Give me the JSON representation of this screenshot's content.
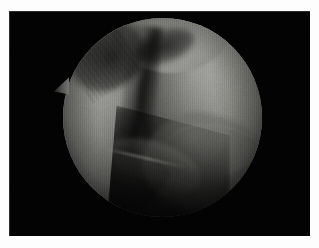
{
  "image": {
    "kind": "arthroscopic-photograph",
    "caption": "Arthroscopic view of a knee joint showing two opposing cartilage-covered condylar surfaces separated by a dark intercondylar fissure.",
    "medium": "endoscopic video still print",
    "orientation": "landscape"
  },
  "mount": {
    "name": "white photographic border",
    "color": "#fdfdfd",
    "border_left_px": 9,
    "border_top_px": 11
  },
  "frame": {
    "name": "photograph",
    "background_color": "#020202",
    "left_px": 9,
    "top_px": 11,
    "width_px": 301,
    "height_px": 225
  },
  "scope_field": {
    "name": "circular endoscope field of view",
    "shape": "circle",
    "center_x_px": 162,
    "center_y_px": 117,
    "radius_px": 99,
    "vignette": "strong",
    "scanlines": "vertical interlace texture"
  },
  "anatomy": {
    "structures": [
      {
        "id": "condyle-left",
        "label": "Left condylar surface",
        "tone": "mid grey",
        "highlight_color": "#9b9b97",
        "shadow_color": "#141413"
      },
      {
        "id": "condyle-right",
        "label": "Right condylar surface (brightest)",
        "tone": "light grey",
        "highlight_color": "#a0a09c",
        "shadow_color": "#1a1a19"
      },
      {
        "id": "superior-dome",
        "label": "Superior trochlear dome",
        "tone": "light grey",
        "highlight_color": "#9a9a96",
        "shadow_color": "#2a2a28"
      },
      {
        "id": "fissure-central",
        "label": "Intercondylar fissure",
        "tone": "dark",
        "shadow_color": "#000000"
      },
      {
        "id": "recess-upper-left",
        "label": "Upper-left shadowed recess",
        "tone": "dark",
        "shadow_color": "#0a0a0a"
      },
      {
        "id": "shadow-wedge",
        "label": "Inferior shadow wedge",
        "tone": "very dark",
        "shadow_color": "#000000"
      },
      {
        "id": "inferior-plane",
        "label": "Lower-right tissue plane",
        "tone": "dim grey",
        "highlight_color": "#70706c"
      },
      {
        "id": "rim-spike",
        "label": "Triangular instrument tip at left rim",
        "tone": "mid grey",
        "highlight_color": "#6a6a66",
        "tip_x_px": 54,
        "tip_y_px": 80
      }
    ]
  },
  "palette": {
    "paper_white": "#fdfdfd",
    "frame_black": "#020202",
    "tissue_highlight": "#a0a09c",
    "tissue_midtone": "#74746f",
    "tissue_shadow": "#2a2a28",
    "cavity_black": "#060606"
  }
}
